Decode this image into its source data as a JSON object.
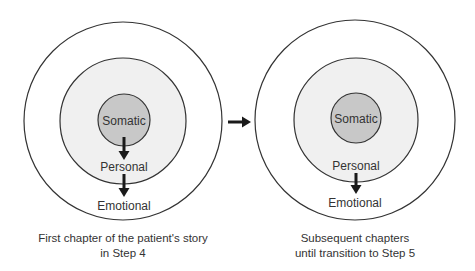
{
  "diagrams": [
    {
      "id": "left",
      "inner_label": "Somatic",
      "middle_label": "Personal",
      "outer_label": "Emotional",
      "caption_line1": "First chapter of the patient's story",
      "caption_line2": "in Step 4"
    },
    {
      "id": "right",
      "inner_label": "Somatic",
      "middle_label": "Personal",
      "outer_label": "Emotional",
      "caption_line1": "Subsequent chapters",
      "caption_line2": "until transition to Step 5"
    }
  ],
  "colors": {
    "inner_fill": "#c8c8c8",
    "middle_fill": "#f0f0f0",
    "outer_fill": "#ffffff",
    "stroke": "#333333",
    "arrow": "#1a1a1a"
  }
}
